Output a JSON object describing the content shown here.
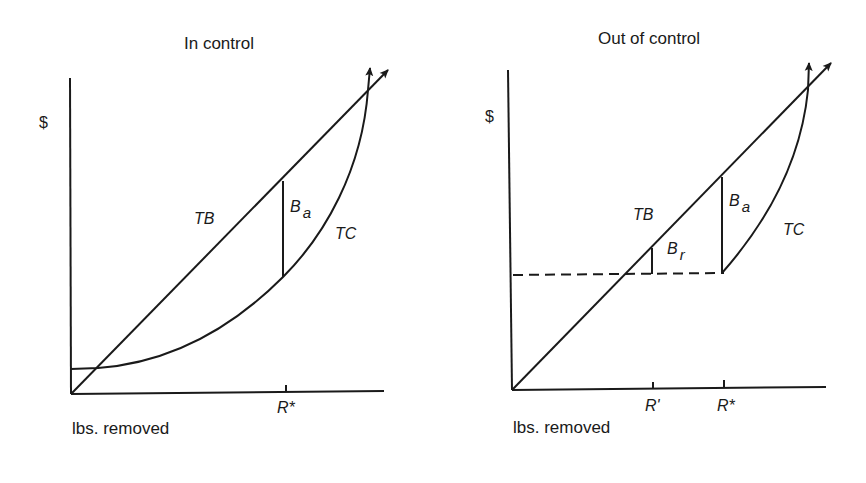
{
  "panels": [
    {
      "title": "In control",
      "y_axis_label": "$",
      "x_axis_label": "lbs. removed",
      "curves": [
        {
          "name": "TB",
          "label": "TB",
          "kind": "total benefit, linear from origin"
        },
        {
          "name": "TC",
          "label": "TC",
          "kind": "total cost, convex, positive intercept"
        }
      ],
      "annotations": [
        {
          "label": "B",
          "subscript": "a",
          "meaning": "vertical gap TB-TC at R*"
        }
      ],
      "x_ticks": [
        "R*"
      ]
    },
    {
      "title": "Out of control",
      "y_axis_label": "$",
      "x_axis_label": "lbs. removed",
      "curves": [
        {
          "name": "TB",
          "label": "TB",
          "kind": "total benefit, linear from origin"
        },
        {
          "name": "TC",
          "label": "TC",
          "kind": "total cost, convex, starting at R*"
        }
      ],
      "annotations": [
        {
          "label": "B",
          "subscript": "a",
          "meaning": "vertical gap TB-TC at R*"
        },
        {
          "label": "B",
          "subscript": "r",
          "meaning": "vertical gap TB-dashed at R'"
        }
      ],
      "x_ticks": [
        "R'",
        "R*"
      ],
      "dashed_line": "horizontal from $ axis to TC start at R*"
    }
  ],
  "colors": {
    "line": "#1a1a1a",
    "background": "#ffffff"
  }
}
